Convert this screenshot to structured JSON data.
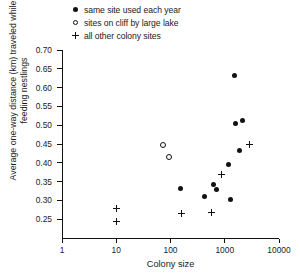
{
  "chart_data": {
    "type": "scatter",
    "title": "",
    "xlabel": "Colony size",
    "ylabel": "Average one-way distance (km) traveled while feeding nestlings",
    "xscale": "log",
    "xlim": [
      1,
      10000
    ],
    "ylim": [
      0.2,
      0.7
    ],
    "xticks": [
      1,
      10,
      100,
      1000,
      10000
    ],
    "xtick_labels": [
      "1",
      "10",
      "100",
      "1000",
      "10000"
    ],
    "yticks": [
      0.25,
      0.3,
      0.35,
      0.4,
      0.45,
      0.5,
      0.55,
      0.6,
      0.65,
      0.7
    ],
    "ytick_labels": [
      "0.25",
      "0.30",
      "0.35",
      "0.40",
      "0.45",
      "0.50",
      "0.55",
      "0.60",
      "0.65",
      "0.70"
    ],
    "grid": false,
    "legend_position": "top-center",
    "series": [
      {
        "name": "same site used each year",
        "marker": "filled-circle",
        "points": [
          {
            "x": 1540,
            "y": 0.633
          },
          {
            "x": 1580,
            "y": 0.505
          },
          {
            "x": 2100,
            "y": 0.513
          },
          {
            "x": 1900,
            "y": 0.432
          },
          {
            "x": 1150,
            "y": 0.395
          },
          {
            "x": 620,
            "y": 0.343
          },
          {
            "x": 700,
            "y": 0.33
          },
          {
            "x": 420,
            "y": 0.31
          },
          {
            "x": 150,
            "y": 0.332
          },
          {
            "x": 1300,
            "y": 0.302
          }
        ]
      },
      {
        "name": "sites on cliff by large lake",
        "marker": "open-circle",
        "points": [
          {
            "x": 73,
            "y": 0.447
          },
          {
            "x": 95,
            "y": 0.415
          }
        ]
      },
      {
        "name": "all other colony sites",
        "marker": "plus",
        "points": [
          {
            "x": 10,
            "y": 0.278
          },
          {
            "x": 10,
            "y": 0.243
          },
          {
            "x": 160,
            "y": 0.265
          },
          {
            "x": 2900,
            "y": 0.448
          },
          {
            "x": 880,
            "y": 0.37
          },
          {
            "x": 560,
            "y": 0.268
          }
        ]
      }
    ]
  },
  "legend": {
    "items": [
      {
        "marker": "filled-circle",
        "label": "same site used each year"
      },
      {
        "marker": "open-circle",
        "label": "sites on cliff by large lake"
      },
      {
        "marker": "plus",
        "label": "all other colony sites"
      }
    ]
  },
  "axes": {
    "x_title": "Colony size",
    "y_title": "Average one-way distance (km) traveled while feeding nestlings"
  },
  "colors": {
    "ink": "#111111",
    "background": "#ffffff"
  }
}
